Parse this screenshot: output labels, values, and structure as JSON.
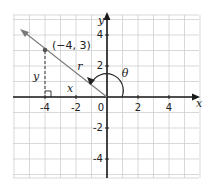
{
  "diagram": {
    "type": "coordinate-plane-angle",
    "x_axis": {
      "label": "x",
      "ticks": [
        "-4",
        "-2",
        "0",
        "2",
        "4"
      ],
      "tick_values": [
        -4,
        -2,
        0,
        2,
        4
      ]
    },
    "y_axis": {
      "label": "y",
      "ticks": [
        "4",
        "2",
        "-2",
        "-4"
      ],
      "tick_values": [
        4,
        2,
        -2,
        -4
      ]
    },
    "grid": {
      "x_range": [
        -6,
        6
      ],
      "y_range": [
        -5,
        5
      ],
      "step": 1
    },
    "point": {
      "label": "(−4, 3)",
      "x": -4,
      "y": 3
    },
    "segment_labels": {
      "radius": "r",
      "horizontal": "x",
      "vertical": "y"
    },
    "angle_label": "θ",
    "colors": {
      "axis": "#1a1a1a",
      "grid": "#cfcfcf",
      "ray": "#7a7a7a"
    }
  }
}
